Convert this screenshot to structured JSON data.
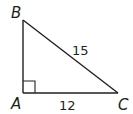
{
  "figure": {
    "type": "right triangle",
    "vertices": {
      "A": {
        "label": "A",
        "right_angle": true
      },
      "B": {
        "label": "B"
      },
      "C": {
        "label": "C"
      }
    },
    "sides": {
      "AB": {
        "label": ""
      },
      "BC": {
        "label": "15"
      },
      "AC": {
        "label": "12"
      }
    },
    "colors": {
      "stroke": "#231f20",
      "background": "#ffffff"
    }
  }
}
